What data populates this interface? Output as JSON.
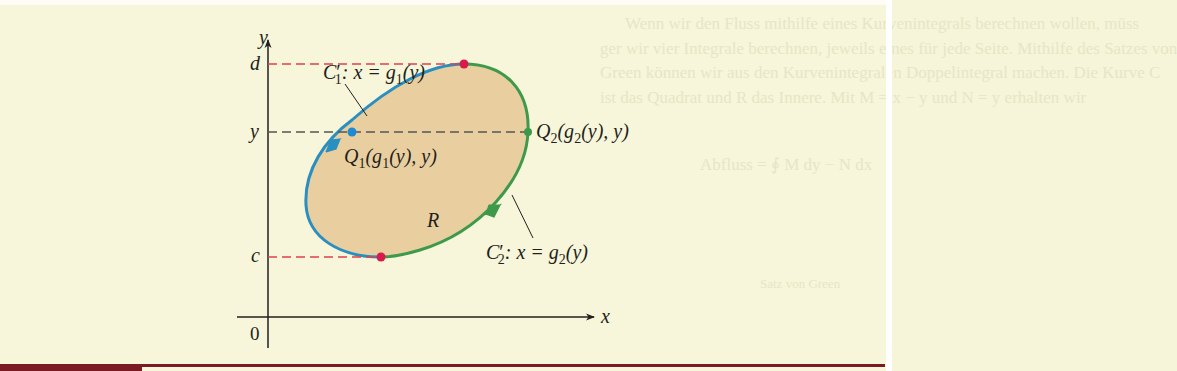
{
  "figure": {
    "axes": {
      "x_label": "x",
      "y_label": "y",
      "origin_label": "0"
    },
    "levels": {
      "d_label": "d",
      "y_label": "y",
      "c_label": "c"
    },
    "region_label": "R",
    "curves": {
      "c1_label_main": "C",
      "c1_label_sub": "1",
      "c1_label_rest": ":  x = g",
      "c1_label_sub2": "1",
      "c1_label_end": "(y)",
      "c2_label_main": "C",
      "c2_label_sub": "2",
      "c2_label_rest": ":  x = g",
      "c2_label_sub2": "2",
      "c2_label_end": "(y)"
    },
    "points": {
      "q1_main": "Q",
      "q1_sub": "1",
      "q1_rest_a": "(g",
      "q1_sub2": "1",
      "q1_rest_b": "(y), y)",
      "q2_main": "Q",
      "q2_sub": "2",
      "q2_rest_a": "(g",
      "q2_sub2": "2",
      "q2_rest_b": "(y), y)"
    },
    "colors": {
      "region_fill": "#e9cf9f",
      "curve_c1": "#2a8fc0",
      "curve_c2": "#3e9a4a",
      "dash_red": "#e0404a",
      "dash_gray": "#555555",
      "point_red": "#d81b4a",
      "point_blue": "#1e8ad0",
      "point_green": "#3a9a4a",
      "bar": "#7a1a22"
    }
  },
  "background_text": {
    "line1": "Wenn wir den Fluss mithilfe eines Kurvenintegrals berechnen wollen, müss",
    "line2": "ger wir vier Integrale berechnen, jeweils eines für jede Seite. Mithilfe des Satzes von",
    "line3": "Green können wir aus den Kurvenintegralen Doppelintegral machen. Die Kurve C",
    "line4": "ist das Quadrat und R das Innere. Mit M = x − y und N = y erhalten wir",
    "formula": "Abfluss = ∮ M dy − N dx",
    "note": "Satz von Green"
  }
}
